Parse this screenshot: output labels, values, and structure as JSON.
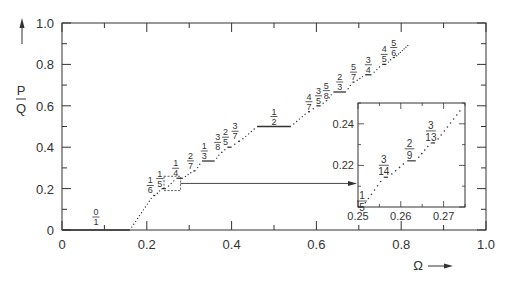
{
  "chart_data": {
    "type": "line",
    "title": "",
    "xlabel": "Ω",
    "ylabel": "P/Q",
    "xlim": [
      0,
      1.0
    ],
    "ylim": [
      0,
      1.0
    ],
    "x_ticks": [
      "0",
      "0.2",
      "0.4",
      "0.6",
      "0.8",
      "1.0"
    ],
    "y_ticks": [
      "0",
      "0.2",
      "0.4",
      "0.6",
      "0.8",
      "1.0"
    ],
    "grid": false,
    "legend": null,
    "steps": [
      {
        "label": "0/1",
        "value": 0.0,
        "x_start": 0.0,
        "x_end": 0.16
      },
      {
        "label": "1/6",
        "value": 0.1667,
        "x_start": 0.215,
        "x_end": 0.22
      },
      {
        "label": "1/5",
        "value": 0.2,
        "x_start": 0.235,
        "x_end": 0.245
      },
      {
        "label": "1/4",
        "value": 0.25,
        "x_start": 0.27,
        "x_end": 0.285
      },
      {
        "label": "2/7",
        "value": 0.2857,
        "x_start": 0.31,
        "x_end": 0.315
      },
      {
        "label": "1/3",
        "value": 0.3333,
        "x_start": 0.33,
        "x_end": 0.36
      },
      {
        "label": "3/8",
        "value": 0.375,
        "x_start": 0.375,
        "x_end": 0.378
      },
      {
        "label": "2/5",
        "value": 0.4,
        "x_start": 0.39,
        "x_end": 0.4
      },
      {
        "label": "3/7",
        "value": 0.4286,
        "x_start": 0.415,
        "x_end": 0.42
      },
      {
        "label": "1/2",
        "value": 0.5,
        "x_start": 0.46,
        "x_end": 0.54
      },
      {
        "label": "4/7",
        "value": 0.5714,
        "x_start": 0.58,
        "x_end": 0.585
      },
      {
        "label": "3/5",
        "value": 0.6,
        "x_start": 0.6,
        "x_end": 0.61
      },
      {
        "label": "5/8",
        "value": 0.625,
        "x_start": 0.622,
        "x_end": 0.625
      },
      {
        "label": "2/3",
        "value": 0.6667,
        "x_start": 0.64,
        "x_end": 0.67
      },
      {
        "label": "5/7",
        "value": 0.7143,
        "x_start": 0.685,
        "x_end": 0.69
      },
      {
        "label": "3/4",
        "value": 0.75,
        "x_start": 0.715,
        "x_end": 0.73
      },
      {
        "label": "4/5",
        "value": 0.8,
        "x_start": 0.755,
        "x_end": 0.765
      },
      {
        "label": "5/6",
        "value": 0.8333,
        "x_start": 0.78,
        "x_end": 0.785
      }
    ],
    "inset": {
      "xlim": [
        0.25,
        0.275
      ],
      "ylim": [
        0.2,
        0.25
      ],
      "x_ticks": [
        "0.25",
        "0.26",
        "0.27"
      ],
      "y_ticks": [
        "0.22",
        "0.24"
      ],
      "steps": [
        {
          "label": "1/5",
          "value": 0.2,
          "x_start": 0.25,
          "x_end": 0.251
        },
        {
          "label": "3/14",
          "value": 0.2143,
          "x_start": 0.256,
          "x_end": 0.257
        },
        {
          "label": "2/9",
          "value": 0.2222,
          "x_start": 0.2615,
          "x_end": 0.2635
        },
        {
          "label": "3/13",
          "value": 0.2308,
          "x_start": 0.267,
          "x_end": 0.268
        }
      ],
      "zoom_region": {
        "x": [
          0.25,
          0.275
        ],
        "y": [
          0.2,
          0.25
        ]
      }
    }
  },
  "labels": {
    "y_axis_numerator": "P",
    "y_axis_denominator": "Q",
    "x_axis": "Ω"
  }
}
